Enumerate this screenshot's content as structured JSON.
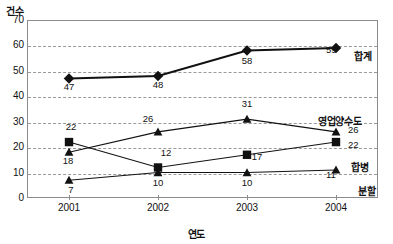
{
  "chart_data": {
    "type": "line",
    "title": "",
    "xlabel": "연도",
    "ylabel": "건수",
    "categories": [
      "2001",
      "2002",
      "2003",
      "2004"
    ],
    "ylim": [
      0,
      70
    ],
    "ytick_values": [
      0,
      10,
      20,
      30,
      40,
      50,
      60,
      70
    ],
    "ytick_labels": [
      "0",
      "10",
      "20",
      "30",
      "40",
      "50",
      "60",
      "70"
    ],
    "grid": true,
    "legend_position": "inline-right-of-last-point",
    "series": [
      {
        "name": "합계",
        "marker": "diamond",
        "values": [
          47,
          48,
          58,
          59
        ],
        "value_labels": [
          "47",
          "48",
          "58",
          "59"
        ]
      },
      {
        "name": "영업양수도",
        "marker": "triangle",
        "values": [
          18,
          26,
          31,
          26
        ],
        "value_labels": [
          "18",
          "26",
          "31",
          "26"
        ]
      },
      {
        "name": "합병",
        "marker": "square",
        "values": [
          22,
          12,
          17,
          22
        ],
        "value_labels": [
          "22",
          "12",
          "17",
          "22"
        ]
      },
      {
        "name": "분할",
        "marker": "triangle",
        "values": [
          7,
          10,
          10,
          11
        ],
        "value_labels": [
          "7",
          "10",
          "10",
          "11"
        ]
      }
    ],
    "colors": {
      "line": "#111111",
      "grid": "#9a9a9a",
      "axis": "#8c8c8c",
      "background": "#ffffff"
    }
  }
}
